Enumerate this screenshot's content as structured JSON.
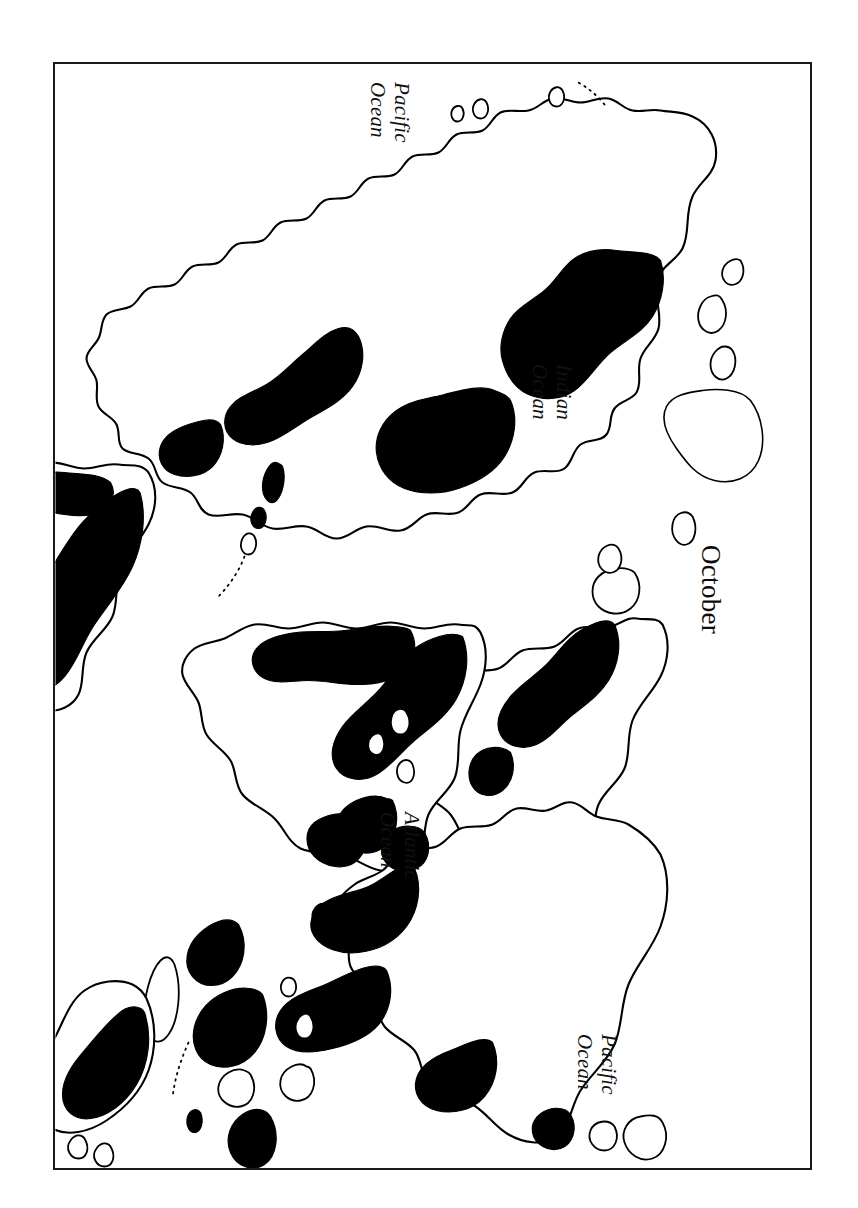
{
  "figure": {
    "caption": "October",
    "frame": {
      "border_color": "#1a1a1a"
    },
    "shade_color": "#000000",
    "coast_color": "#000000",
    "background_color": "#ffffff",
    "orientation_note": "map rotated 90 degrees clockwise on the page"
  },
  "labels": {
    "pacific_top": {
      "line1": "Pacific",
      "line2": "Ocean"
    },
    "indian": {
      "line1": "Indian",
      "line2": "Ocean"
    },
    "atlantic": {
      "line1": "Atlantic",
      "line2": "Ocean"
    },
    "pacific_bottom": {
      "line1": "Pacific",
      "line2": "Ocean"
    }
  },
  "map_content": {
    "type": "world-outline-map",
    "projection_hint": "cylindrical world map",
    "legend": "black shading marks the mapped region extent for the month",
    "oceans_labelled": [
      "Pacific Ocean",
      "Indian Ocean",
      "Atlantic Ocean",
      "Pacific Ocean"
    ],
    "landmasses": [
      "North America",
      "South America",
      "Europe",
      "Africa",
      "Asia",
      "Australia",
      "Greenland",
      "New Zealand",
      "Japan",
      "Indonesia",
      "Madagascar",
      "Caribbean islands",
      "British Isles"
    ],
    "shaded_regions": [
      "western North America",
      "eastern North America",
      "Central America and Caribbean",
      "northern South America",
      "eastern Brazil",
      "western Europe",
      "West Africa",
      "East Africa",
      "Madagascar",
      "India",
      "Southeast Asia",
      "Indonesia",
      "eastern China",
      "Japan",
      "northern Australia",
      "New Guinea"
    ]
  }
}
